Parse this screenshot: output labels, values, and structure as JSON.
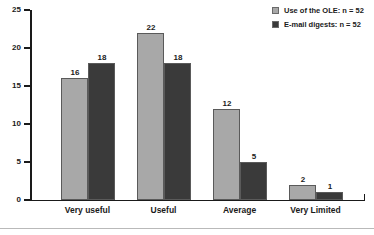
{
  "chart_data": {
    "type": "bar",
    "title": "",
    "xlabel": "",
    "ylabel": "",
    "ylim": [
      0,
      25
    ],
    "yticks": [
      0,
      5,
      10,
      15,
      20,
      25
    ],
    "grid": false,
    "legend_position": "top-right",
    "categories": [
      "Very useful",
      "Useful",
      "Average",
      "Very Limited"
    ],
    "series": [
      {
        "name": "Use of the OLE: n = 52",
        "color": "#a8a8a8",
        "values": [
          16,
          22,
          12,
          2
        ]
      },
      {
        "name": "E-mail digests: n = 52",
        "color": "#3a3a3a",
        "values": [
          18,
          18,
          5,
          1
        ]
      }
    ]
  },
  "axis": {
    "y_tick_labels": [
      "0",
      "5",
      "10",
      "15",
      "20",
      "25"
    ]
  },
  "legend": {
    "items": [
      {
        "label": "Use of the OLE: n = 52",
        "color": "#a8a8a8"
      },
      {
        "label": "E-mail digests: n = 52",
        "color": "#3a3a3a"
      }
    ]
  }
}
